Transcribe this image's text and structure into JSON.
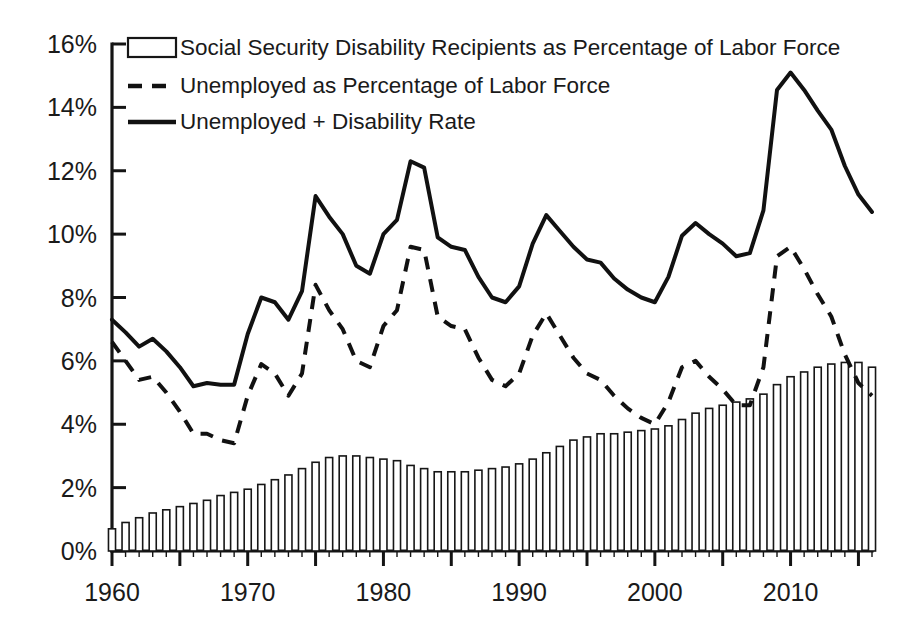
{
  "chart_data": {
    "type": "bar",
    "title": "",
    "xlabel": "",
    "ylabel": "",
    "xlim": [
      1960,
      2016
    ],
    "ylim": [
      0,
      16
    ],
    "y_tick_values": [
      0,
      2,
      4,
      6,
      8,
      10,
      12,
      14,
      16
    ],
    "y_tick_labels": [
      "0%",
      "2%",
      "4%",
      "6%",
      "8%",
      "10%",
      "12%",
      "14%",
      "16%"
    ],
    "x_tick_values": [
      1960,
      1970,
      1980,
      1990,
      2000,
      2010
    ],
    "x_tick_labels": [
      "1960",
      "1970",
      "1980",
      "1990",
      "2000",
      "2010"
    ],
    "x_minor_step": 5,
    "grid": false,
    "legend_position": "top-left",
    "x": [
      1960,
      1961,
      1962,
      1963,
      1964,
      1965,
      1966,
      1967,
      1968,
      1969,
      1970,
      1971,
      1972,
      1973,
      1974,
      1975,
      1976,
      1977,
      1978,
      1979,
      1980,
      1981,
      1982,
      1983,
      1984,
      1985,
      1986,
      1987,
      1988,
      1989,
      1990,
      1991,
      1992,
      1993,
      1994,
      1995,
      1996,
      1997,
      1998,
      1999,
      2000,
      2001,
      2002,
      2003,
      2004,
      2005,
      2006,
      2007,
      2008,
      2009,
      2010,
      2011,
      2012,
      2013,
      2014,
      2015,
      2016
    ],
    "series": [
      {
        "name": "Social Security Disability Recipients as Percentage of Labor Force",
        "render": "bar",
        "style": "hollow-outline",
        "values": [
          0.7,
          0.9,
          1.05,
          1.2,
          1.3,
          1.4,
          1.5,
          1.6,
          1.75,
          1.85,
          1.95,
          2.1,
          2.25,
          2.4,
          2.6,
          2.8,
          2.95,
          3.0,
          3.0,
          2.95,
          2.9,
          2.85,
          2.7,
          2.6,
          2.5,
          2.5,
          2.5,
          2.55,
          2.6,
          2.65,
          2.75,
          2.9,
          3.1,
          3.3,
          3.5,
          3.6,
          3.7,
          3.7,
          3.75,
          3.8,
          3.85,
          3.95,
          4.15,
          4.35,
          4.5,
          4.6,
          4.7,
          4.8,
          4.95,
          5.25,
          5.5,
          5.65,
          5.8,
          5.9,
          5.95,
          5.95,
          5.8
        ],
        "units": "percent"
      },
      {
        "name": "Unemployed as Percentage of Labor Force",
        "render": "line",
        "style": "dashed",
        "values": [
          6.6,
          6.0,
          5.4,
          5.5,
          5.0,
          4.4,
          3.7,
          3.7,
          3.5,
          3.4,
          4.9,
          5.9,
          5.6,
          4.9,
          5.6,
          8.4,
          7.6,
          7.0,
          6.0,
          5.8,
          7.1,
          7.6,
          9.6,
          9.5,
          7.4,
          7.1,
          7.0,
          6.1,
          5.4,
          5.2,
          5.6,
          6.8,
          7.5,
          6.8,
          6.1,
          5.6,
          5.4,
          4.9,
          4.5,
          4.2,
          4.0,
          4.7,
          5.8,
          6.0,
          5.5,
          5.1,
          4.6,
          4.6,
          5.8,
          9.3,
          9.6,
          8.9,
          8.1,
          7.4,
          6.2,
          5.3,
          4.9
        ],
        "units": "percent"
      },
      {
        "name": "Unemployed + Disability Rate",
        "render": "line",
        "style": "solid",
        "values": [
          7.3,
          6.9,
          6.45,
          6.7,
          6.3,
          5.8,
          5.2,
          5.3,
          5.25,
          5.25,
          6.85,
          8.0,
          7.85,
          7.3,
          8.2,
          11.2,
          10.55,
          10.0,
          9.0,
          8.75,
          10.0,
          10.45,
          12.3,
          12.1,
          9.9,
          9.6,
          9.5,
          8.65,
          8.0,
          7.85,
          8.35,
          9.7,
          10.6,
          10.1,
          9.6,
          9.2,
          9.1,
          8.6,
          8.25,
          8.0,
          7.85,
          8.65,
          9.95,
          10.35,
          10.0,
          9.7,
          9.3,
          9.4,
          10.75,
          14.55,
          15.1,
          14.55,
          13.9,
          13.3,
          12.15,
          11.25,
          10.7
        ],
        "units": "percent"
      }
    ]
  },
  "legend": {
    "items": [
      {
        "label": "Social Security Disability Recipients as Percentage of Labor Force",
        "marker": "hollow-box"
      },
      {
        "label": "Unemployed as Percentage of Labor Force",
        "marker": "dashed-line"
      },
      {
        "label": "Unemployed + Disability Rate",
        "marker": "solid-line"
      }
    ]
  },
  "colors": {
    "ink": "#111111",
    "axis": "#141414",
    "background": "#ffffff",
    "bar_fill": "#ffffff",
    "bar_stroke": "#161616"
  }
}
